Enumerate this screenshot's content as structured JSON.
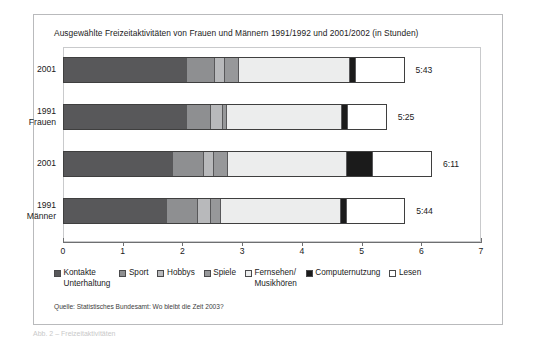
{
  "figure": {
    "title": "Ausgewählte Freizeitaktivitäten von Frauen und Männern 1991/1992 und 2001/2002 (in Stunden)",
    "source": "Quelle: Statistisches Bundesamt: Wo bleibt die Zeit 2003?",
    "caption": "Abb. 2 – Freizeitaktivitäten"
  },
  "chart_data": {
    "type": "bar",
    "orientation": "horizontal",
    "stacked": true,
    "title": "Ausgewählte Freizeitaktivitäten von Frauen und Männern 1991/1992 und 2001/2002 (in Stunden)",
    "xlabel": "",
    "ylabel": "",
    "xlim": [
      0,
      7
    ],
    "xticks": [
      "0",
      "1",
      "2",
      "3",
      "4",
      "5",
      "6",
      "7"
    ],
    "grid": false,
    "legend_position": "bottom",
    "categories": [
      {
        "lines": [
          "2001"
        ]
      },
      {
        "lines": [
          "1991",
          "Frauen"
        ]
      },
      {
        "lines": [
          "2001"
        ]
      },
      {
        "lines": [
          "1991",
          "Männer"
        ]
      }
    ],
    "series": [
      {
        "name": "Kontakte\nUnterhaltung",
        "color": "#58585a",
        "values": [
          2.08,
          2.08,
          1.83,
          1.73
        ]
      },
      {
        "name": "Sport",
        "color": "#8e8f91",
        "values": [
          0.47,
          0.4,
          0.52,
          0.52
        ]
      },
      {
        "name": "Hobbys",
        "color": "#b8b9bb",
        "values": [
          0.17,
          0.2,
          0.17,
          0.22
        ]
      },
      {
        "name": "Spiele",
        "color": "#97989a",
        "values": [
          0.22,
          0.07,
          0.22,
          0.18
        ]
      },
      {
        "name": "Fernsehen/\nMusikhören",
        "color": "#eceded",
        "values": [
          1.87,
          1.93,
          2.0,
          2.02
        ]
      },
      {
        "name": "Computernutzung",
        "color": "#1b1b1b",
        "values": [
          0.11,
          0.1,
          0.43,
          0.09
        ]
      },
      {
        "name": "Lesen",
        "color": "#ffffff",
        "values": [
          0.8,
          0.64,
          0.8,
          0.97
        ]
      }
    ],
    "totals": [
      "5:43",
      "5:25",
      "6:11",
      "5:44"
    ],
    "total_values": [
      5.72,
      5.42,
      6.18,
      5.73
    ]
  }
}
